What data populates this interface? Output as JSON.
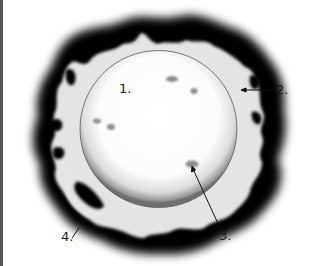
{
  "diagram": {
    "labels": [
      {
        "id": "1",
        "text": "1.",
        "x": 119,
        "y": 82
      },
      {
        "id": "2",
        "text": "2.",
        "x": 276,
        "y": 82
      },
      {
        "id": "3",
        "text": "3.",
        "x": 219,
        "y": 229
      },
      {
        "id": "4",
        "text": "4.",
        "x": 61,
        "y": 230
      }
    ],
    "colors": {
      "corona_dark": "#000000",
      "chromosphere": "#e6e6e6",
      "photosphere": "#ffffff",
      "spot": "#808080",
      "leader": "#111111"
    }
  }
}
